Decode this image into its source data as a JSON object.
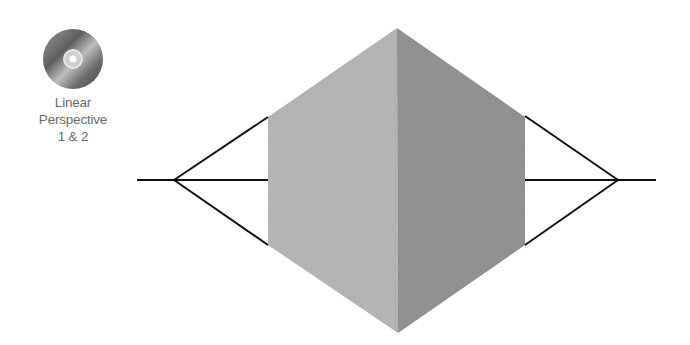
{
  "cd_badge": {
    "icon": "cd-disc-icon",
    "label_lines": [
      "Linear",
      "Perspective",
      "1 & 2"
    ]
  },
  "diagram": {
    "colors": {
      "left_face": "#b3b3b3",
      "right_face": "#8e8e8e",
      "lines": "#111111",
      "label": "#6b6b6b"
    },
    "horizon": {
      "y": 180,
      "x_start": 137,
      "x_end": 656
    },
    "vanishing_points": [
      {
        "name": "left",
        "x": 174,
        "y": 180
      },
      {
        "name": "right",
        "x": 618,
        "y": 180
      }
    ],
    "cube": {
      "top": [
        397,
        28
      ],
      "bottom": [
        398,
        333
      ],
      "left_top": [
        268,
        117
      ],
      "left_bottom": [
        268,
        245
      ],
      "right_top": [
        525,
        117
      ],
      "right_bottom": [
        525,
        245
      ]
    }
  }
}
